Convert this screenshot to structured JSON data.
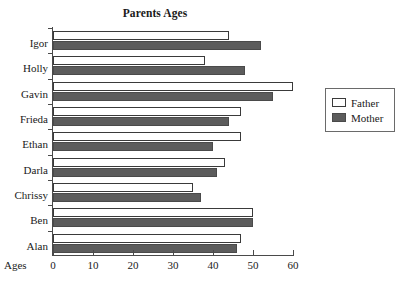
{
  "chart_data": {
    "type": "bar",
    "orientation": "horizontal",
    "title": "Parents Ages",
    "xlabel": "Ages",
    "ylabel": "",
    "xlim": [
      0,
      60
    ],
    "xticks": [
      0,
      10,
      20,
      30,
      40,
      50,
      60
    ],
    "grid": false,
    "legend_position": "right",
    "categories": [
      "Igor",
      "Holly",
      "Gavin",
      "Frieda",
      "Ethan",
      "Darla",
      "Chrissy",
      "Ben",
      "Alan"
    ],
    "series": [
      {
        "name": "Father",
        "color": "#ffffff",
        "values": [
          44,
          38,
          60,
          47,
          47,
          43,
          35,
          50,
          47
        ]
      },
      {
        "name": "Mother",
        "color": "#5c5c5c",
        "values": [
          52,
          48,
          55,
          44,
          40,
          41,
          37,
          50,
          46
        ]
      }
    ]
  },
  "legend": {
    "items": [
      {
        "label": "Father",
        "swatch": "father"
      },
      {
        "label": "Mother",
        "swatch": "mother"
      }
    ]
  },
  "colors": {
    "father_fill": "#ffffff",
    "mother_fill": "#5c5c5c",
    "axis": "#4a4a4a",
    "text": "#1a1a1a",
    "background": "#ffffff"
  }
}
